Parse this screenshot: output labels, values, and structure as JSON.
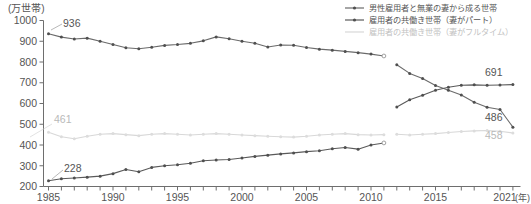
{
  "chart_data": {
    "type": "line",
    "title": "",
    "xlabel": "(年)",
    "ylabel": "(万世帯)",
    "ylim": [
      200,
      1000
    ],
    "xlim": [
      1985,
      2021
    ],
    "grid": false,
    "legend_position": "top-right",
    "y_ticks": [
      200,
      300,
      400,
      500,
      600,
      700,
      800,
      900,
      1000
    ],
    "x_ticks": [
      1985,
      1990,
      1995,
      2000,
      2005,
      2010,
      2015,
      2021
    ],
    "x_tick_labels": [
      "1985",
      "1990",
      "1995",
      "2000",
      "2005",
      "2010",
      "2015",
      "2021"
    ],
    "note_break_year": 2011,
    "x": [
      1985,
      1986,
      1987,
      1988,
      1989,
      1990,
      1991,
      1992,
      1993,
      1994,
      1995,
      1996,
      1997,
      1998,
      1999,
      2000,
      2001,
      2002,
      2003,
      2004,
      2005,
      2006,
      2007,
      2008,
      2009,
      2010,
      2011,
      2012,
      2013,
      2014,
      2015,
      2016,
      2017,
      2018,
      2019,
      2020,
      2021
    ],
    "series": [
      {
        "name": "男性雇用者と無業の妻から成る世帯",
        "color": "#6b6b6b",
        "values": [
          936,
          920,
          911,
          915,
          900,
          884,
          869,
          864,
          871,
          880,
          884,
          890,
          902,
          921,
          912,
          900,
          890,
          872,
          882,
          881,
          870,
          862,
          857,
          851,
          845,
          838,
          829,
          822,
          812,
          802,
          797,
          792,
          787,
          782,
          778,
          774,
          770
        ]
      },
      {
        "name": "雇用者の共働き世帯（妻がパート）",
        "color": "#5a5a5a",
        "values": [
          228,
          237,
          241,
          245,
          250,
          262,
          282,
          271,
          292,
          300,
          305,
          312,
          324,
          328,
          330,
          337,
          345,
          351,
          357,
          362,
          368,
          372,
          382,
          388,
          380,
          400,
          410,
          415,
          420,
          418,
          422,
          424,
          426,
          428,
          430,
          432,
          434
        ]
      },
      {
        "name": "雇用者の共働き世帯（妻がフルタイム）",
        "color": "#d8d8d8",
        "values": [
          461,
          440,
          430,
          442,
          452,
          455,
          450,
          445,
          452,
          455,
          452,
          448,
          452,
          455,
          452,
          448,
          445,
          442,
          440,
          438,
          442,
          448,
          452,
          455,
          450,
          448,
          450,
          452,
          448,
          452,
          455,
          460,
          465,
          468,
          470,
          466,
          458
        ]
      }
    ],
    "post_break_series": [
      {
        "name": "男性雇用者と無業の妻から成る世帯",
        "x": [
          2012,
          2013,
          2014,
          2015,
          2016,
          2017,
          2018,
          2019,
          2020,
          2021
        ],
        "values": [
          787,
          745,
          720,
          687,
          664,
          641,
          606,
          582,
          571,
          486
        ]
      },
      {
        "name": "雇用者の共働き世帯（妻がパート）",
        "x": [
          2012,
          2013,
          2014,
          2015,
          2016,
          2017,
          2018,
          2019,
          2020,
          2021
        ],
        "values": [
          583,
          618,
          640,
          664,
          678,
          688,
          690,
          688,
          689,
          691
        ]
      }
    ],
    "annotations": [
      {
        "text": "936",
        "value": 936,
        "year": 1985,
        "style": "dark"
      },
      {
        "text": "461",
        "value": 461,
        "year": 1985,
        "style": "light"
      },
      {
        "text": "228",
        "value": 228,
        "year": 1985,
        "style": "dark"
      },
      {
        "text": "691",
        "value": 691,
        "year": 2021,
        "style": "dark"
      },
      {
        "text": "486",
        "value": 486,
        "year": 2021,
        "style": "dark"
      },
      {
        "text": "458",
        "value": 458,
        "year": 2021,
        "style": "light"
      }
    ],
    "legend": [
      {
        "label": "男性雇用者と無業の妻から成る世帯",
        "color": "#6b6b6b",
        "marker": true
      },
      {
        "label": "雇用者の共働き世帯（妻がパート）",
        "color": "#5a5a5a",
        "marker": true
      },
      {
        "label": "雇用者の共働き世帯（妻がフルタイム）",
        "color": "#d8d8d8",
        "marker": false
      }
    ]
  },
  "axes": {
    "y_unit": "(万世帯)",
    "x_unit": "(年)",
    "y_tick_labels": [
      "1000",
      "900",
      "800",
      "700",
      "600",
      "500",
      "400",
      "300",
      "200"
    ],
    "x_tick_labels": [
      "1985",
      "1990",
      "1995",
      "2000",
      "2005",
      "2010",
      "2015",
      "2021"
    ]
  },
  "annotation_labels": {
    "a936": "936",
    "a461": "461",
    "a228": "228",
    "a691": "691",
    "a486": "486",
    "a458": "458"
  },
  "legend_labels": {
    "l0": "男性雇用者と無業の妻から成る世帯",
    "l1": "雇用者の共働き世帯（妻がパート）",
    "l2": "雇用者の共働き世帯（妻がフルタイム）"
  }
}
